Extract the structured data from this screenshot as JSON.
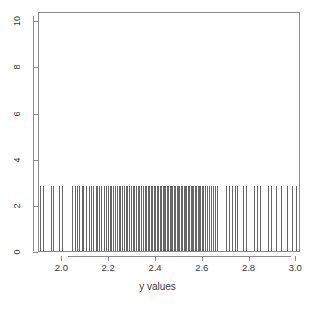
{
  "chart_data": {
    "type": "rug",
    "title": "",
    "subtitle": "",
    "xlabel": "y values",
    "ylabel": "",
    "grid": false,
    "legend": null,
    "xlim": [
      1.9,
      3.02
    ],
    "ylim": [
      0,
      10.4
    ],
    "x_ticks": [
      2.0,
      2.2,
      2.4,
      2.6,
      2.8,
      3.0
    ],
    "x_tick_labels": [
      "2.0",
      "2.2",
      "2.4",
      "2.6",
      "2.8",
      "3.0"
    ],
    "y_ticks": [
      0,
      2,
      4,
      6,
      8,
      10
    ],
    "y_tick_labels": [
      "0",
      "2",
      "4",
      "6",
      "8",
      "10"
    ],
    "series": [
      {
        "name": "y values rug",
        "rug_height": 1.0,
        "values": [
          1.905,
          1.918,
          1.952,
          1.96,
          1.985,
          1.998,
          2.043,
          2.052,
          2.061,
          2.072,
          2.083,
          2.09,
          2.099,
          2.112,
          2.121,
          2.131,
          2.142,
          2.149,
          2.158,
          2.167,
          2.176,
          2.186,
          2.194,
          2.202,
          2.208,
          2.216,
          2.224,
          2.233,
          2.24,
          2.247,
          2.253,
          2.262,
          2.27,
          2.277,
          2.286,
          2.293,
          2.3,
          2.308,
          2.314,
          2.322,
          2.329,
          2.337,
          2.344,
          2.351,
          2.358,
          2.365,
          2.371,
          2.378,
          2.385,
          2.391,
          2.397,
          2.403,
          2.41,
          2.416,
          2.422,
          2.428,
          2.434,
          2.44,
          2.446,
          2.452,
          2.458,
          2.464,
          2.47,
          2.476,
          2.482,
          2.488,
          2.494,
          2.5,
          2.506,
          2.512,
          2.518,
          2.524,
          2.53,
          2.536,
          2.542,
          2.548,
          2.554,
          2.56,
          2.566,
          2.572,
          2.578,
          2.584,
          2.59,
          2.596,
          2.603,
          2.61,
          2.618,
          2.626,
          2.634,
          2.643,
          2.652,
          2.662,
          2.7,
          2.712,
          2.724,
          2.736,
          2.748,
          2.772,
          2.784,
          2.82,
          2.831,
          2.843,
          2.878,
          2.89,
          2.913,
          2.936,
          2.96,
          2.983,
          3.0
        ]
      }
    ]
  }
}
